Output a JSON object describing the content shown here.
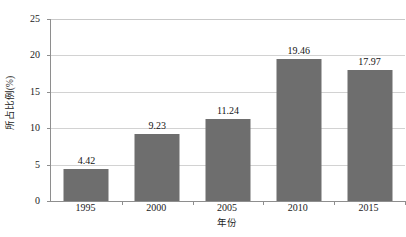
{
  "chart_data": {
    "type": "bar",
    "title": "",
    "subtitle": "",
    "xlabel": "年份",
    "ylabel": "所占比例(%)",
    "categories": [
      "1995",
      "2000",
      "2005",
      "2010",
      "2015"
    ],
    "values": [
      4.42,
      9.23,
      11.24,
      19.46,
      17.97
    ],
    "value_labels": [
      "4.42",
      "9.23",
      "11.24",
      "19.46",
      "17.97"
    ],
    "ylim": [
      0,
      25
    ],
    "ytick_values": [
      0,
      5,
      10,
      15,
      20,
      25
    ],
    "ytick_labels": [
      "0",
      "5",
      "10",
      "15",
      "20",
      "25"
    ],
    "grid": "horizontal",
    "legend": "none",
    "annotations": [],
    "series": [
      {
        "name": "所占比例(%)",
        "values": [
          4.42,
          9.23,
          11.24,
          19.46,
          17.97
        ]
      }
    ]
  },
  "style": {
    "bar_color": "#6e6e6e",
    "gridline_color": "#d2d2d2",
    "axis_color": "#8e8e8e",
    "text_color": "#1b1b1b",
    "background": "#ffffff"
  }
}
